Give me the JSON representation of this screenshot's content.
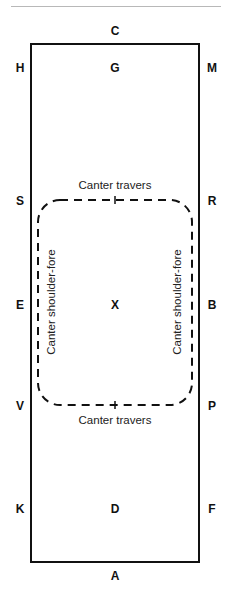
{
  "diagram": {
    "markers": {
      "C": "C",
      "A": "A",
      "H": "H",
      "G": "G",
      "M": "M",
      "S": "S",
      "R": "R",
      "E": "E",
      "X": "X",
      "B": "B",
      "V": "V",
      "P": "P",
      "K": "K",
      "D": "D",
      "F": "F",
      "I": "I",
      "L": "L"
    },
    "labels": {
      "top": "Canter travers",
      "bottom": "Canter travers",
      "left": "Canter shoulder-fore",
      "right": "Canter shoulder-fore"
    },
    "colors": {
      "line": "#111111",
      "rule": "#b8b8b8"
    }
  }
}
